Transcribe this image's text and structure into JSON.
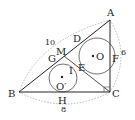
{
  "figure": {
    "points": {
      "A": "A",
      "B": "B",
      "C": "C",
      "D": "D",
      "E": "E",
      "F": "F",
      "G": "G",
      "H": "H",
      "I": "I",
      "M": "M",
      "O": "O",
      "O2": "O′"
    },
    "lengths": {
      "AB": "10",
      "AC": "6",
      "BC": "8"
    }
  }
}
